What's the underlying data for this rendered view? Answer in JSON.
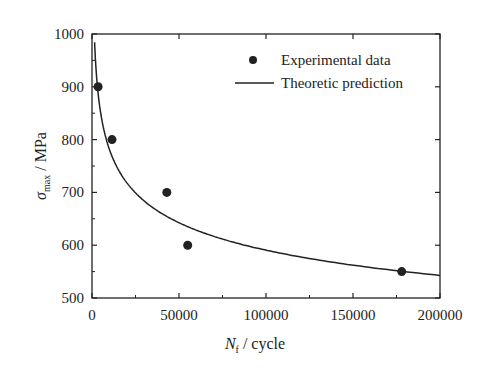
{
  "chart_data": {
    "type": "scatter",
    "title": "",
    "xlabel": "N_f / cycle",
    "ylabel": "σ_max / MPa",
    "xlim": [
      0,
      200000
    ],
    "ylim": [
      500,
      1000
    ],
    "xticks": [
      0,
      50000,
      100000,
      150000,
      200000
    ],
    "yticks": [
      500,
      600,
      700,
      800,
      900,
      1000
    ],
    "grid": false,
    "legend_position": "upper right",
    "series": [
      {
        "name": "Experimental data",
        "type": "scatter",
        "x": [
          3500,
          11500,
          43000,
          55000,
          178000
        ],
        "y": [
          900,
          800,
          700,
          600,
          550
        ]
      },
      {
        "name": "Theoretic prediction",
        "type": "line",
        "model": "power",
        "A": 2395,
        "b": -0.1216,
        "x_start": 1500,
        "x_end": 200000
      }
    ]
  },
  "labels": {
    "xlabel_main": "N",
    "xlabel_sub": "f",
    "xlabel_rest": " / cycle",
    "ylabel_main": "σ",
    "ylabel_sub": "max",
    "ylabel_rest": " / MPa",
    "legend_points": "Experimental data",
    "legend_line": "Theoretic prediction"
  }
}
